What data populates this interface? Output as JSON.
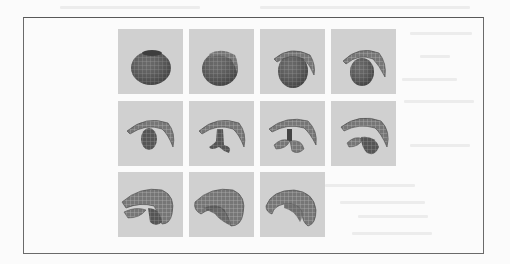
{
  "page": {
    "type": "scanned-document-page",
    "background": "#fbfbfb"
  },
  "figure": {
    "layout": {
      "rows": 3,
      "columns": 4,
      "frame_count": 11
    },
    "colors": {
      "frame_border": "#6a6a6a",
      "cell_background": "#d0d0d0",
      "shape_dark": "#4e4e4e",
      "shape_mid": "#6f6f6f",
      "grid_line": "#9a9a9a"
    },
    "frames": [
      {
        "index": 1,
        "row": 1,
        "col": 1,
        "stage": "closed-sphere"
      },
      {
        "index": 2,
        "row": 1,
        "col": 2,
        "stage": "sphere-opening"
      },
      {
        "index": 3,
        "row": 1,
        "col": 3,
        "stage": "sphere-with-arc"
      },
      {
        "index": 4,
        "row": 1,
        "col": 4,
        "stage": "smaller-sphere-with-arc"
      },
      {
        "index": 5,
        "row": 2,
        "col": 1,
        "stage": "arc-with-ellipsoid"
      },
      {
        "index": 6,
        "row": 2,
        "col": 2,
        "stage": "arc-with-stem"
      },
      {
        "index": 7,
        "row": 2,
        "col": 3,
        "stage": "arc-with-lobes"
      },
      {
        "index": 8,
        "row": 2,
        "col": 4,
        "stage": "arc-with-tube-forming"
      },
      {
        "index": 9,
        "row": 3,
        "col": 1,
        "stage": "split-tube"
      },
      {
        "index": 10,
        "row": 3,
        "col": 2,
        "stage": "tube-nearly-closed"
      },
      {
        "index": 11,
        "row": 3,
        "col": 3,
        "stage": "curved-tube"
      }
    ]
  }
}
